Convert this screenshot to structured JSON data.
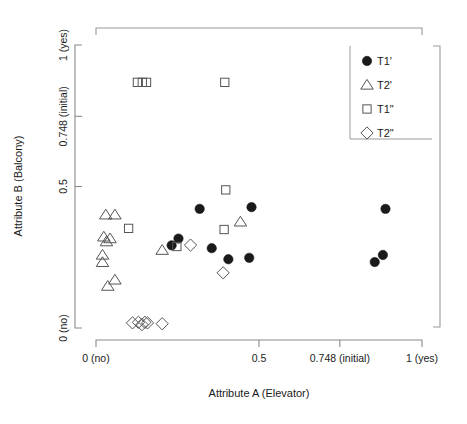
{
  "chart_data": {
    "type": "scatter",
    "title": "",
    "xlabel": "Attribute A (Elevator)",
    "ylabel": "Attribute B (Balcony)",
    "xlim": [
      0,
      1
    ],
    "ylim": [
      0,
      1
    ],
    "grid": false,
    "legend_position": "top-right",
    "xticks": [
      {
        "value": 0,
        "label": "0 (no)"
      },
      {
        "value": 0.5,
        "label": "0.5"
      },
      {
        "value": 0.748,
        "label": "0.748 (initial)"
      },
      {
        "value": 1,
        "label": "1 (yes)"
      }
    ],
    "yticks": [
      {
        "value": 0,
        "label": "0 (no)"
      },
      {
        "value": 0.5,
        "label": "0.5"
      },
      {
        "value": 0.748,
        "label": "0.748 (initial)"
      },
      {
        "value": 1,
        "label": "1 (yes)"
      }
    ],
    "series": [
      {
        "name": "T1'",
        "marker": "filled-circle",
        "color": "#1a1a1a",
        "points": [
          [
            0.318,
            0.421
          ],
          [
            0.477,
            0.427
          ],
          [
            0.888,
            0.421
          ],
          [
            0.253,
            0.316
          ],
          [
            0.232,
            0.292
          ],
          [
            0.355,
            0.282
          ],
          [
            0.406,
            0.243
          ],
          [
            0.47,
            0.248
          ],
          [
            0.855,
            0.233
          ],
          [
            0.88,
            0.258
          ]
        ]
      },
      {
        "name": "T2'",
        "marker": "open-triangle",
        "color": "#555555",
        "points": [
          [
            0.03,
            0.4
          ],
          [
            0.058,
            0.4
          ],
          [
            0.024,
            0.322
          ],
          [
            0.032,
            0.305
          ],
          [
            0.043,
            0.316
          ],
          [
            0.02,
            0.258
          ],
          [
            0.02,
            0.232
          ],
          [
            0.058,
            0.17
          ],
          [
            0.036,
            0.148
          ],
          [
            0.203,
            0.275
          ],
          [
            0.443,
            0.375
          ]
        ]
      },
      {
        "name": "T1\"",
        "marker": "open-square",
        "color": "#555555",
        "points": [
          [
            0.127,
            0.868
          ],
          [
            0.142,
            0.868
          ],
          [
            0.155,
            0.868
          ],
          [
            0.395,
            0.868
          ],
          [
            0.398,
            0.488
          ],
          [
            0.1,
            0.352
          ],
          [
            0.393,
            0.348
          ],
          [
            0.248,
            0.288
          ]
        ]
      },
      {
        "name": "T2\"",
        "marker": "open-diamond",
        "color": "#555555",
        "points": [
          [
            0.29,
            0.293
          ],
          [
            0.39,
            0.195
          ],
          [
            0.112,
            0.018
          ],
          [
            0.13,
            0.02
          ],
          [
            0.141,
            0.012
          ],
          [
            0.15,
            0.02
          ],
          [
            0.158,
            0.018
          ],
          [
            0.203,
            0.015
          ]
        ]
      }
    ]
  },
  "legend": {
    "entries": [
      {
        "label": "T1'",
        "marker": "filled-circle"
      },
      {
        "label": "T2'",
        "marker": "open-triangle"
      },
      {
        "label": "T1\"",
        "marker": "open-square"
      },
      {
        "label": "T2\"",
        "marker": "open-diamond"
      }
    ]
  }
}
